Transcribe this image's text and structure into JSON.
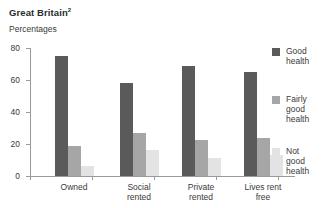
{
  "title": "Great Britain",
  "title_footnote": "2",
  "subtitle": "Percentages",
  "chart_data": {
    "type": "bar",
    "title": "Great Britain",
    "subtitle": "Percentages",
    "xlabel": "",
    "ylabel": "Percentages",
    "ylim": [
      0,
      80
    ],
    "yticks": [
      0,
      20,
      40,
      60,
      80
    ],
    "grid": false,
    "legend_position": "right",
    "categories": [
      "Owned",
      "Social rented",
      "Private rented",
      "Lives rent free"
    ],
    "series": [
      {
        "name": "Good health",
        "color": "#5a5a5a",
        "values": [
          75,
          58,
          68.5,
          65
        ]
      },
      {
        "name": "Fairly good health",
        "color": "#a6a6a6",
        "values": [
          19,
          27,
          22.5,
          24
        ]
      },
      {
        "name": "Not good health",
        "color": "#e3e3e3",
        "values": [
          6,
          16,
          11,
          13
        ]
      }
    ]
  },
  "axis": {
    "y_tick_labels": [
      "80",
      "60",
      "40",
      "20",
      "0"
    ]
  },
  "categories": [
    {
      "line1": "Owned",
      "line2": ""
    },
    {
      "line1": "Social",
      "line2": "rented"
    },
    {
      "line1": "Private",
      "line2": "rented"
    },
    {
      "line1": "Lives rent",
      "line2": "free"
    }
  ],
  "legend": [
    {
      "line1": "Good",
      "line2": "health",
      "line3": ""
    },
    {
      "line1": "Fairly",
      "line2": "good",
      "line3": "health"
    },
    {
      "line1": "Not",
      "line2": "good",
      "line3": "health"
    }
  ]
}
